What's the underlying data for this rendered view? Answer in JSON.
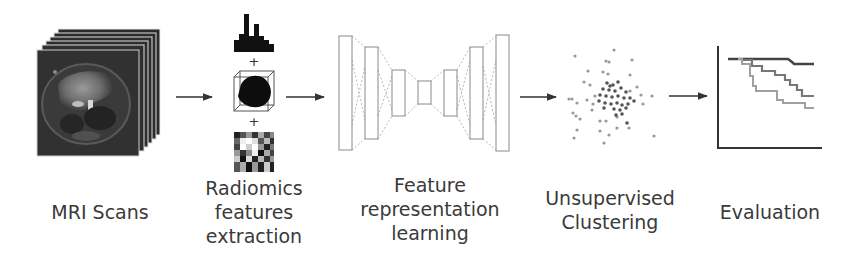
{
  "diagram": {
    "type": "pipeline",
    "steps": [
      {
        "id": "mri",
        "label_lines": [
          "MRI Scans"
        ],
        "icon": "mri-slice-stack-icon"
      },
      {
        "id": "radiomics",
        "label_lines": [
          "Radiomics",
          "features",
          "extraction"
        ],
        "icon": "radiomics-features-icon",
        "sub_icons": [
          "histogram-icon",
          "3d-shape-cube-icon",
          "texture-matrix-icon"
        ],
        "separator": "+"
      },
      {
        "id": "representation",
        "label_lines": [
          "Feature",
          "representation",
          "learning"
        ],
        "icon": "autoencoder-network-icon"
      },
      {
        "id": "clustering",
        "label_lines": [
          "Unsupervised",
          "Clustering"
        ],
        "icon": "scatter-cluster-icon"
      },
      {
        "id": "evaluation",
        "label_lines": [
          "Evaluation"
        ],
        "icon": "survival-curve-icon"
      }
    ],
    "connectors": [
      {
        "from": "mri",
        "to": "radiomics",
        "type": "arrow"
      },
      {
        "from": "radiomics",
        "to": "representation",
        "type": "arrow"
      },
      {
        "from": "representation",
        "to": "clustering",
        "type": "arrow"
      },
      {
        "from": "clustering",
        "to": "evaluation",
        "type": "arrow"
      }
    ],
    "colors": {
      "text": "#3a3a3a",
      "arrow": "#333333",
      "mri_dark": "#2b2b2b",
      "network_line": "#9a9a9a",
      "curve_dark": "#444444",
      "curve_mid": "#777777",
      "curve_light": "#a0a0a0"
    }
  }
}
